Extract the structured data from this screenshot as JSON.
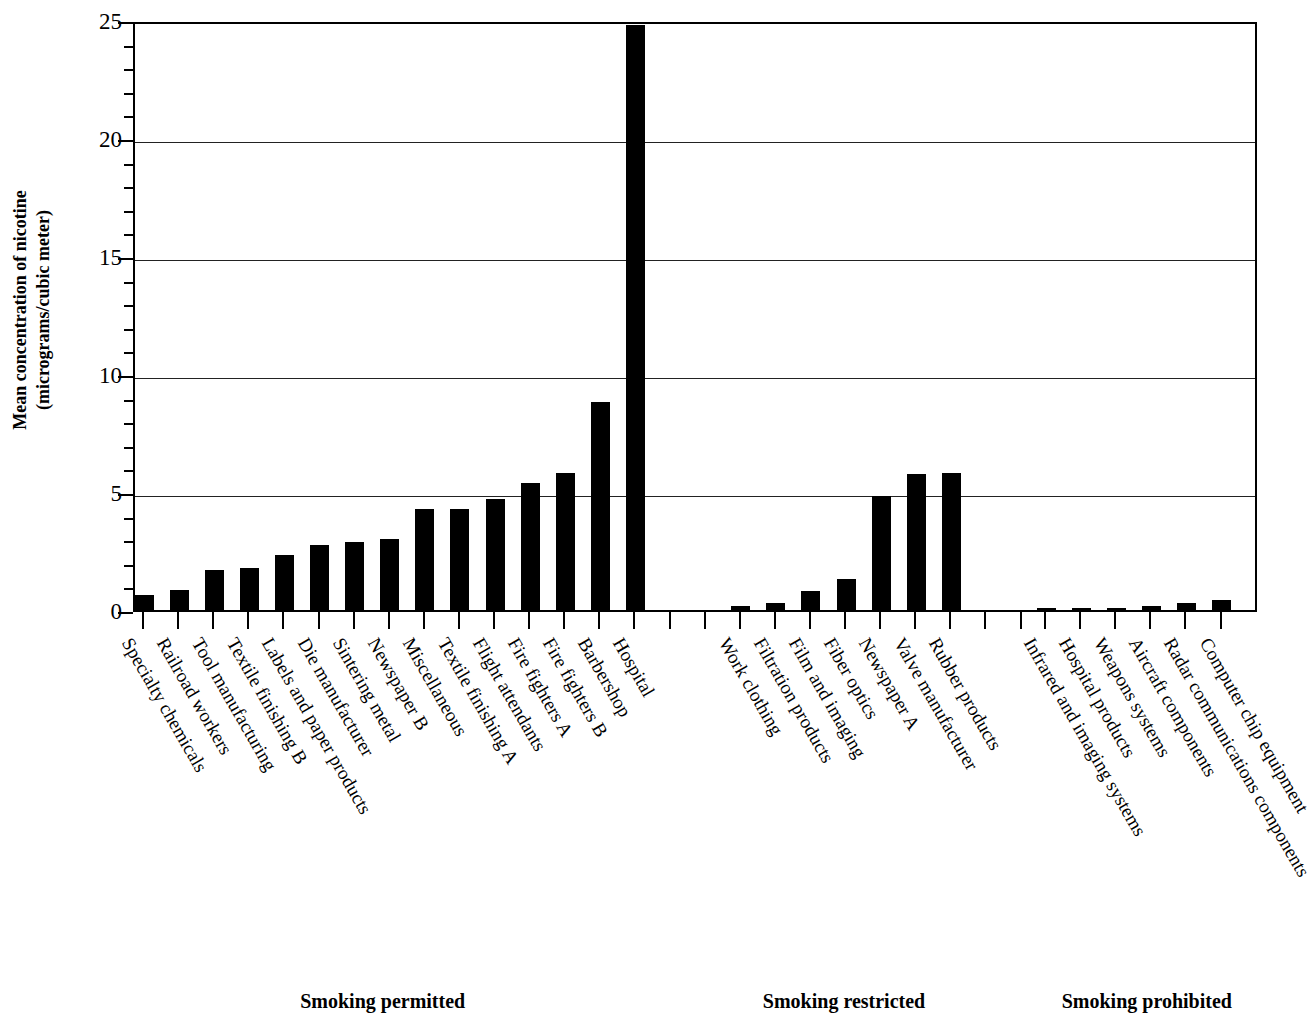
{
  "chart_data": {
    "type": "bar",
    "title": "",
    "xlabel": "",
    "ylabel": "Mean concentration of nicotine (micrograms/cubic meter)",
    "ylabel_line1": "Mean concentration of nicotine",
    "ylabel_line2": "(micrograms/cubic meter)",
    "ylim": [
      0,
      25
    ],
    "ytick_labels": [
      "0",
      "5",
      "10",
      "15",
      "20",
      "25"
    ],
    "ytick_values": [
      0,
      5,
      10,
      15,
      20,
      25
    ],
    "minor_tick_step": 1,
    "grid": "horizontal-major",
    "legend": "none",
    "bar_color": "#000000",
    "groups": [
      {
        "name": "Smoking permitted",
        "caption": "Smoking permitted",
        "categories": [
          "Specialty chemicals",
          "Railroad workers",
          "Tool manufacturing",
          "Textile finishing B",
          "Labels and paper products",
          "Die manufacturer",
          "Sintering metal",
          "Newspaper B",
          "Miscellaneous",
          "Textile finishing A",
          "Flight attendants",
          "Fire fighters A",
          "Fire fighters B",
          "Barbershop",
          "Hospital"
        ],
        "values": [
          0.65,
          0.85,
          1.7,
          1.8,
          2.35,
          2.75,
          2.9,
          3.0,
          4.3,
          4.3,
          4.7,
          5.4,
          5.8,
          8.8,
          24.8
        ]
      },
      {
        "name": "Smoking restricted",
        "caption": "Smoking restricted",
        "categories": [
          "Work clothing",
          "Filtration products",
          "Film and imaging",
          "Fiber optics",
          "Newspaper A",
          "Valve manufacturer",
          "Rubber products"
        ],
        "values": [
          0.15,
          0.28,
          0.8,
          1.3,
          4.85,
          5.75,
          5.8
        ]
      },
      {
        "name": "Smoking prohibited",
        "caption": "Smoking prohibited",
        "categories": [
          "Infrared and imaging systems",
          "Hospital products",
          "Weapons systems",
          "Aircraft components",
          "Radar communications components",
          "Computer chip equipment"
        ],
        "values": [
          0.06,
          0.06,
          0.07,
          0.15,
          0.28,
          0.42
        ]
      }
    ]
  }
}
